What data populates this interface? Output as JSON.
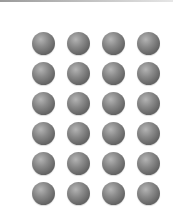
{
  "grid": {
    "rows": 6,
    "columns": 4,
    "ball_color": "#777777",
    "column_centers": [
      43,
      78,
      113,
      148
    ],
    "row_centers": [
      43,
      73,
      103,
      133,
      163,
      193
    ],
    "ball_diameter": 23
  }
}
